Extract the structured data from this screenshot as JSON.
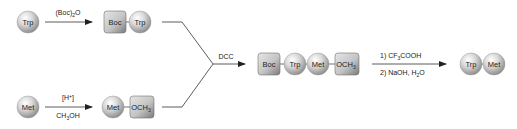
{
  "diagram": {
    "type": "reaction-scheme",
    "colors": {
      "sphere_light": "#f2f2f2",
      "sphere_dark": "#8c8c8c",
      "box_light": "#d8d8d8",
      "box_dark": "#7a7a7a",
      "line": "#333333",
      "text": "#222222"
    },
    "step1": {
      "reactant": "Trp",
      "reagent_top": "(Boc)2O",
      "reagent_top_parts": [
        "(Boc)",
        "2",
        "O"
      ],
      "product": [
        "Boc",
        "Trp"
      ]
    },
    "step2": {
      "reactant": "Met",
      "reagent_top": "[H+]",
      "reagent_top_parts": [
        "[H",
        "+",
        "]"
      ],
      "reagent_bottom": "CH3OH",
      "reagent_bottom_parts": [
        "CH",
        "3",
        "OH"
      ],
      "product": [
        "Met",
        "OCH3"
      ],
      "product_ester_parts": [
        "OCH",
        "3"
      ]
    },
    "coupling": {
      "reagent": "DCC",
      "product": [
        "Boc",
        "Trp",
        "Met",
        "OCH3"
      ],
      "product_ester_parts": [
        "OCH",
        "3"
      ]
    },
    "deprotection": {
      "reagent_top": "1) CF3COOH",
      "reagent_top_parts": [
        "1) CF",
        "3",
        "COOH"
      ],
      "reagent_bottom": "2) NaOH, H2O",
      "reagent_bottom_parts": [
        "2) NaOH, H",
        "2",
        "O"
      ],
      "product": [
        "Trp",
        "Met"
      ]
    }
  }
}
